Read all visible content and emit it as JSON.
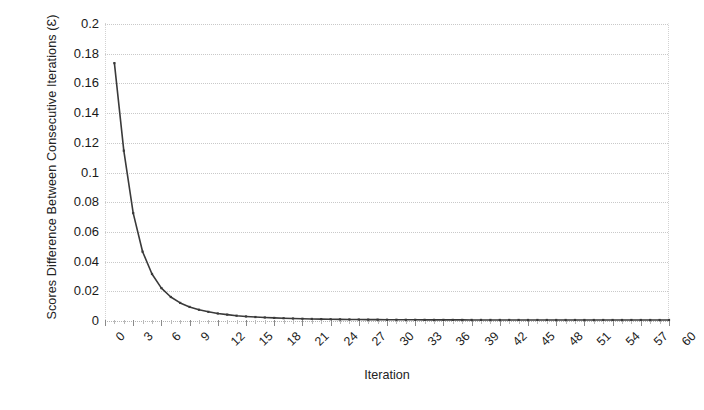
{
  "chart_data": {
    "type": "line",
    "title": "",
    "xlabel": "Iteration",
    "ylabel": "Scores Difference Between Consecutive Iterations (Ɛ)",
    "xlim": [
      0,
      60
    ],
    "ylim": [
      0,
      0.2
    ],
    "grid": true,
    "legend": "none",
    "line_color": "#3a3a3a",
    "x_tick_labels": [
      "0",
      "3",
      "6",
      "9",
      "12",
      "15",
      "18",
      "21",
      "24",
      "27",
      "30",
      "33",
      "36",
      "39",
      "42",
      "45",
      "48",
      "51",
      "54",
      "57",
      "60"
    ],
    "x_tick_values": [
      0,
      3,
      6,
      9,
      12,
      15,
      18,
      21,
      24,
      27,
      30,
      33,
      36,
      39,
      42,
      45,
      48,
      51,
      54,
      57,
      60
    ],
    "y_tick_labels": [
      "0",
      "0.02",
      "0.04",
      "0.06",
      "0.08",
      "0.1",
      "0.12",
      "0.14",
      "0.16",
      "0.18",
      "0.2"
    ],
    "y_tick_values": [
      0,
      0.02,
      0.04,
      0.06,
      0.08,
      0.1,
      0.12,
      0.14,
      0.16,
      0.18,
      0.2
    ],
    "x": [
      1,
      2,
      3,
      4,
      5,
      6,
      7,
      8,
      9,
      10,
      11,
      12,
      13,
      14,
      15,
      16,
      17,
      18,
      19,
      20,
      21,
      22,
      23,
      24,
      25,
      26,
      27,
      28,
      29,
      30,
      31,
      32,
      33,
      34,
      35,
      36,
      37,
      38,
      39,
      40,
      41,
      42,
      43,
      44,
      45,
      46,
      47,
      48,
      49,
      50,
      51,
      52,
      53,
      54,
      55,
      56,
      57,
      58,
      59,
      60
    ],
    "values": [
      0.173,
      0.114,
      0.072,
      0.046,
      0.031,
      0.0215,
      0.0155,
      0.0115,
      0.0088,
      0.0069,
      0.0055,
      0.0044,
      0.0036,
      0.0029,
      0.0024,
      0.002,
      0.0017,
      0.0014,
      0.0012,
      0.001,
      0.00085,
      0.00072,
      0.00061,
      0.00052,
      0.00044,
      0.00038,
      0.00032,
      0.00027,
      0.00023,
      0.0002,
      0.00017,
      0.00015,
      0.00013,
      0.00011,
      9e-05,
      8e-05,
      7e-05,
      6e-05,
      5e-05,
      4.5e-05,
      4e-05,
      3.5e-05,
      3e-05,
      2.6e-05,
      2.2e-05,
      1.9e-05,
      1.7e-05,
      1.5e-05,
      1.3e-05,
      1.1e-05,
      1e-05,
      9e-06,
      8e-06,
      7e-06,
      6e-06,
      5.5e-06,
      5e-06,
      4.5e-06,
      4e-06,
      3.5e-06
    ],
    "series_name": "Scores Difference"
  },
  "axes": {
    "x_title": "Iteration",
    "y_title": "Scores Difference Between Consecutive Iterations (Ɛ)"
  }
}
